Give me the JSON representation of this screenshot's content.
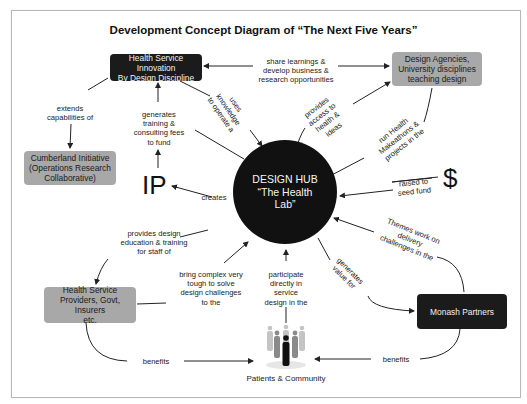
{
  "title": "Development Concept Diagram of “The Next Five Years”",
  "hub": {
    "line1": "DESIGN HUB",
    "line2": "“The Health",
    "line3": "Lab”"
  },
  "nodes": {
    "health_service_innovation": "Health Service Innovation\nBy Design Discipline",
    "design_agencies": "Design Agencies,\nUniversity disciplines\nteaching design",
    "cumberland": "Cumberland Initiative\n(Operations Research\nCollaborative)",
    "health_service_providers": "Health Service\nProviders, Govt, Insurers\netc.",
    "monash_partners": "Monash Partners",
    "ip": "IP",
    "dollar": "$",
    "patients": "Patients & Community"
  },
  "edges": {
    "share_learnings": "share learnings &\ndevelop business &\nresearch opportunities",
    "extends_capabilities": "extends\ncapabilities of",
    "generates_training": "generates\ntraining &\nconsulting fees\nto fund",
    "uses_knowledge": "uses\nknowledge\nto operate a",
    "provides_access": "provides\naccess to\nhealth &\nideas",
    "run_makeathons": "run Health\nMakeathons &\nprojects in the",
    "creates": "creates",
    "raised_seed": "raised to\nseed fund",
    "provides_education": "provides design\neducation & training\nfor staff of",
    "bring_complex": "bring complex very\ntough to solve\ndesign challenges\nto the",
    "participate": "participate\ndirectly in\nservice\ndesign in the",
    "generates_value": "generates\nvalue for",
    "themes_work": "Themes work on\ndelivery\nchallenges in the",
    "benefits_left": "benefits",
    "benefits_right": "benefits"
  },
  "colors": {
    "dark_node": "#1b1b1b",
    "grey_node": "#a8a8a8",
    "hub": "#111111",
    "line": "#222222"
  }
}
